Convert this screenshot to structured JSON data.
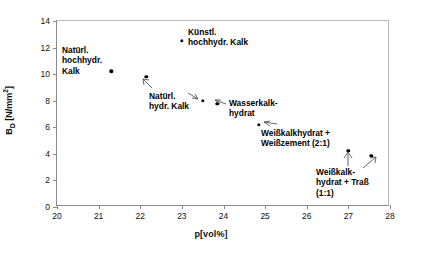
{
  "chart_data": {
    "type": "scatter",
    "title": "",
    "xlabel": "p[vol%]",
    "ylabel": "B_D [N/mm²]",
    "xlim": [
      20,
      28
    ],
    "ylim": [
      0,
      14
    ],
    "xticks": [
      "20",
      "21",
      "22",
      "23",
      "24",
      "25",
      "26",
      "27",
      "28"
    ],
    "yticks": [
      "0",
      "2",
      "4",
      "6",
      "8",
      "10",
      "12",
      "14"
    ],
    "grid": false,
    "legend": "none",
    "x": [
      21.3,
      22.15,
      23.0,
      23.5,
      23.85,
      24.85,
      27.0,
      27.55
    ],
    "y": [
      10.2,
      9.8,
      12.5,
      8.0,
      7.75,
      6.2,
      4.25,
      3.85
    ],
    "points": [
      {
        "x": 21.3,
        "y": 10.2,
        "label": "Natürl. hochhydr. Kalk"
      },
      {
        "x": 22.15,
        "y": 9.8,
        "label": "Natürl. hydr. Kalk"
      },
      {
        "x": 23.0,
        "y": 12.5,
        "label": "Künstl. hochhydr. Kalk"
      },
      {
        "x": 23.5,
        "y": 8.0,
        "label": "Natürl. hydr. Kalk"
      },
      {
        "x": 23.85,
        "y": 7.75,
        "label": "Wasserkalkhydrat"
      },
      {
        "x": 24.85,
        "y": 6.2,
        "label": "Weißkalkhydrat + Weißzement (2:1)"
      },
      {
        "x": 27.0,
        "y": 4.25,
        "label": "Weißkalkhydrat + Traß (1:1)"
      },
      {
        "x": 27.55,
        "y": 3.85,
        "label": "Weißkalkhydrat + Traß (1:1)"
      }
    ],
    "annotations": [
      {
        "name": "natuerl-hochhydr-kalk",
        "lines": [
          "Natürl.",
          "hochhydr.",
          "Kalk"
        ]
      },
      {
        "name": "kuenstl-hochhydr-kalk",
        "lines": [
          "Künstl.",
          "hochhydr. Kalk"
        ]
      },
      {
        "name": "natuerl-hydr-kalk",
        "lines": [
          "Natürl.",
          "hydr. Kalk"
        ]
      },
      {
        "name": "wasserkalkhydrat",
        "lines": [
          "Wasserkalk-",
          "hydrat"
        ]
      },
      {
        "name": "weisskalkhydrat-weisszement",
        "lines": [
          "Weißkalkhydrat +",
          "Weißzement (2:1)"
        ]
      },
      {
        "name": "weisskalkhydrat-trass",
        "lines": [
          "Weißkalk-",
          "hydrat + Traß",
          "(1:1)"
        ]
      }
    ]
  }
}
